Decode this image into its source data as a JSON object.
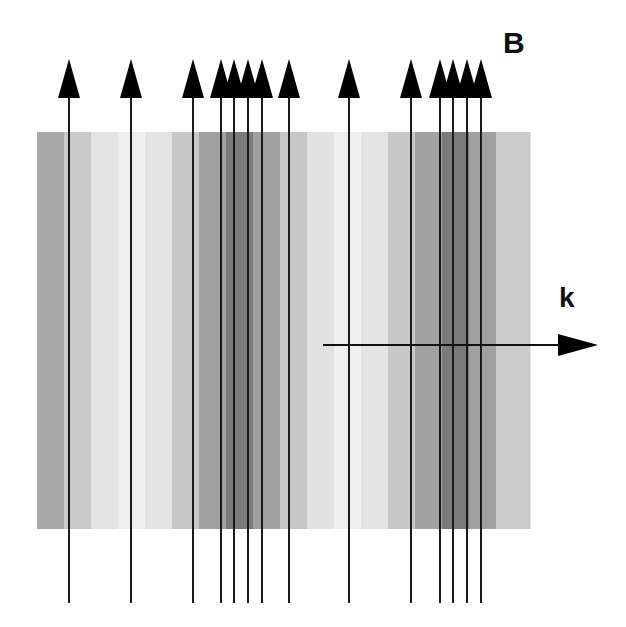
{
  "panel_label": "B",
  "wavevector_label": "k",
  "field": {
    "x": 37,
    "y": 132,
    "width": 493,
    "height": 397,
    "bands": [
      {
        "x": 37,
        "w": 27,
        "color": "#a9a9a9"
      },
      {
        "x": 64,
        "w": 27,
        "color": "#c9c9c9"
      },
      {
        "x": 91,
        "w": 27,
        "color": "#e3e3e3"
      },
      {
        "x": 118,
        "w": 27,
        "color": "#efefef"
      },
      {
        "x": 145,
        "w": 27,
        "color": "#e3e3e3"
      },
      {
        "x": 172,
        "w": 27,
        "color": "#c7c7c7"
      },
      {
        "x": 199,
        "w": 27,
        "color": "#a1a1a1"
      },
      {
        "x": 226,
        "w": 27,
        "color": "#7b7b7b"
      },
      {
        "x": 253,
        "w": 27,
        "color": "#a1a1a1"
      },
      {
        "x": 280,
        "w": 27,
        "color": "#c6c6c6"
      },
      {
        "x": 307,
        "w": 27,
        "color": "#e2e2e2"
      },
      {
        "x": 334,
        "w": 27,
        "color": "#efefef"
      },
      {
        "x": 361,
        "w": 27,
        "color": "#e3e3e3"
      },
      {
        "x": 388,
        "w": 27,
        "color": "#c7c7c7"
      },
      {
        "x": 415,
        "w": 27,
        "color": "#a2a2a2"
      },
      {
        "x": 442,
        "w": 27,
        "color": "#7a7a7a"
      },
      {
        "x": 469,
        "w": 27,
        "color": "#a1a1a1"
      },
      {
        "x": 496,
        "w": 34,
        "color": "#cbcbcb"
      }
    ]
  },
  "field_lines": {
    "x_positions": [
      69,
      131,
      193,
      221,
      234,
      248,
      262,
      289,
      349,
      411,
      440,
      453,
      467,
      481
    ],
    "top_tip_y": 59,
    "head_base_y": 98,
    "bottom_y": 603,
    "head_half_width": 11,
    "color": "#1a1a1a"
  },
  "k_arrow": {
    "x1": 323,
    "y": 345,
    "x2": 558,
    "tip_x": 598,
    "head_half_height": 11,
    "color": "#111111"
  }
}
